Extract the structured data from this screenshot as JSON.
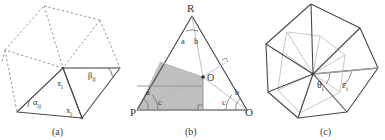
{
  "figure": {
    "panels": [
      {
        "id": "a",
        "caption": "(a)",
        "description": "Triangle fan with cotangent weights; dashed neighboring triangles",
        "labels": [
          {
            "name": "alpha-ij",
            "text": "α",
            "sub": "ij"
          },
          {
            "name": "beta-ij",
            "text": "β",
            "sub": "ij"
          },
          {
            "name": "x-i",
            "text": "x",
            "sub": "i"
          },
          {
            "name": "x-j",
            "text": "x",
            "sub": "j"
          }
        ]
      },
      {
        "id": "b",
        "caption": "(b)",
        "description": "Triangle PRO with circumcenter O and shaded Voronoi cell at P",
        "labels": [
          {
            "name": "vertex-R",
            "text": "R"
          },
          {
            "name": "vertex-P",
            "text": "P"
          },
          {
            "name": "vertex-O",
            "text": "O"
          },
          {
            "name": "vertex-O-center",
            "text": "O"
          },
          {
            "name": "angle-a-top",
            "text": "a"
          },
          {
            "name": "angle-b-top",
            "text": "b"
          },
          {
            "name": "angle-a-left",
            "text": "a"
          },
          {
            "name": "angle-c-left",
            "text": "c"
          },
          {
            "name": "angle-c-right",
            "text": "c"
          },
          {
            "name": "angle-b-right",
            "text": "b"
          }
        ]
      },
      {
        "id": "c",
        "caption": "(c)",
        "description": "Polygon one-ring with dual cell; angles theta_i and epsilon_i",
        "labels": [
          {
            "name": "theta-i",
            "text": "θ",
            "sub": "i"
          },
          {
            "name": "epsilon-i",
            "text": "ε",
            "sub": "i"
          }
        ]
      }
    ],
    "colors": {
      "stroke": "#4a4a4a",
      "dashed": "#8a8a8a",
      "light": "#b8b8b8",
      "shade": "#bcbcbc",
      "text": "#333333",
      "background": "#ffffff"
    }
  }
}
